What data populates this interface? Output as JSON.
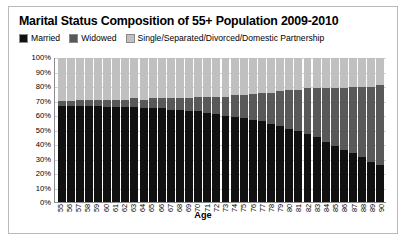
{
  "chart_data": {
    "type": "bar",
    "stacked": true,
    "title": "Marital Status Composition of 55+ Population 2009-2010",
    "xlabel": "Age",
    "ylabel": "",
    "ylim": [
      0,
      100
    ],
    "ytick_labels": [
      "100%",
      "90%",
      "80%",
      "70%",
      "60%",
      "50%",
      "40%",
      "30%",
      "20%",
      "10%",
      "0%"
    ],
    "ytick_values": [
      100,
      90,
      80,
      70,
      60,
      50,
      40,
      30,
      20,
      10,
      0
    ],
    "grid": true,
    "legend_position": "top-left",
    "categories": [
      "55",
      "56",
      "57",
      "58",
      "59",
      "60",
      "61",
      "62",
      "63",
      "64",
      "65",
      "66",
      "67",
      "68",
      "69",
      "70",
      "71",
      "72",
      "73",
      "74",
      "75",
      "76",
      "77",
      "78",
      "79",
      "80",
      "81",
      "82",
      "83",
      "84",
      "85",
      "86",
      "87",
      "88",
      "89",
      "90"
    ],
    "series": [
      {
        "name": "Married",
        "color": "#111111",
        "values": [
          67,
          67,
          67,
          67,
          67,
          66,
          66,
          66,
          66,
          65,
          65,
          65,
          64,
          64,
          63,
          63,
          62,
          61,
          60,
          59,
          58,
          57,
          56,
          54,
          53,
          51,
          49,
          47,
          45,
          42,
          39,
          36,
          34,
          31,
          28,
          26
        ]
      },
      {
        "name": "Widowed",
        "color": "#595959",
        "values": [
          3,
          3,
          4,
          4,
          4,
          5,
          5,
          5,
          6,
          6,
          7,
          7,
          8,
          8,
          9,
          10,
          11,
          12,
          13,
          15,
          16,
          18,
          20,
          22,
          24,
          27,
          29,
          32,
          34,
          37,
          40,
          43,
          46,
          49,
          52,
          55
        ]
      },
      {
        "name": "Single/Separated/Divorced/Domestic Partnership",
        "color": "#c0c0c0",
        "values": [
          30,
          30,
          29,
          29,
          29,
          29,
          29,
          29,
          28,
          29,
          28,
          28,
          28,
          28,
          28,
          27,
          27,
          27,
          27,
          26,
          26,
          25,
          24,
          24,
          23,
          22,
          22,
          21,
          21,
          21,
          21,
          21,
          20,
          20,
          20,
          19
        ]
      }
    ]
  },
  "legend": {
    "items": [
      {
        "label": "Married"
      },
      {
        "label": "Widowed"
      },
      {
        "label": "Single/Separated/Divorced/Domestic Partnership"
      }
    ]
  }
}
